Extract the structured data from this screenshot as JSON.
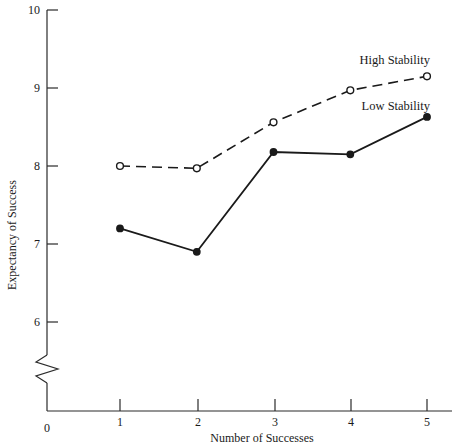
{
  "chart_data": {
    "type": "line",
    "title": "",
    "xlabel": "Number of Successes",
    "ylabel": "Expectancy of Success",
    "x": [
      1,
      2,
      3,
      4,
      5
    ],
    "categories": [
      "1",
      "2",
      "3",
      "4",
      "5"
    ],
    "xtick_labels": [
      "1",
      "2",
      "3",
      "4",
      "5"
    ],
    "ytick_labels": [
      "0",
      "6",
      "7",
      "8",
      "9",
      "10"
    ],
    "ylim": [
      5.6,
      10
    ],
    "xlim": [
      0.4,
      5.5
    ],
    "y_axis_break": true,
    "y_axis_break_note": "axis broken between 0 and 6",
    "grid": false,
    "legend_position": "inline-labels",
    "series": [
      {
        "name": "High Stability",
        "values": [
          8.0,
          7.97,
          8.56,
          8.97,
          9.15
        ],
        "line_style": "dashed",
        "marker": "open-circle",
        "color": "#1a1a1a",
        "label_x": 5,
        "label_y": 9.4
      },
      {
        "name": "Low Stability",
        "values": [
          7.2,
          6.9,
          8.18,
          8.15,
          8.63
        ],
        "line_style": "solid",
        "marker": "filled-circle",
        "color": "#1a1a1a",
        "label_x": 5,
        "label_y": 8.85
      }
    ]
  },
  "axes": {
    "y_title": "Expectancy of Success",
    "x_title": "Number of Successes",
    "y_ticks": [
      {
        "label": "10",
        "y": 10
      },
      {
        "label": "9",
        "y": 9
      },
      {
        "label": "8",
        "y": 8
      },
      {
        "label": "7",
        "y": 7
      },
      {
        "label": "6",
        "y": 6
      },
      {
        "label": "0",
        "y": 0
      }
    ],
    "x_ticks": [
      {
        "label": "1",
        "x": 1
      },
      {
        "label": "2",
        "x": 2
      },
      {
        "label": "3",
        "x": 3
      },
      {
        "label": "4",
        "x": 4
      },
      {
        "label": "5",
        "x": 5
      }
    ]
  },
  "series_labels": {
    "high": "High Stability",
    "low": "Low Stability"
  },
  "colors": {
    "ink": "#1a1a1a",
    "background": "#ffffff"
  }
}
